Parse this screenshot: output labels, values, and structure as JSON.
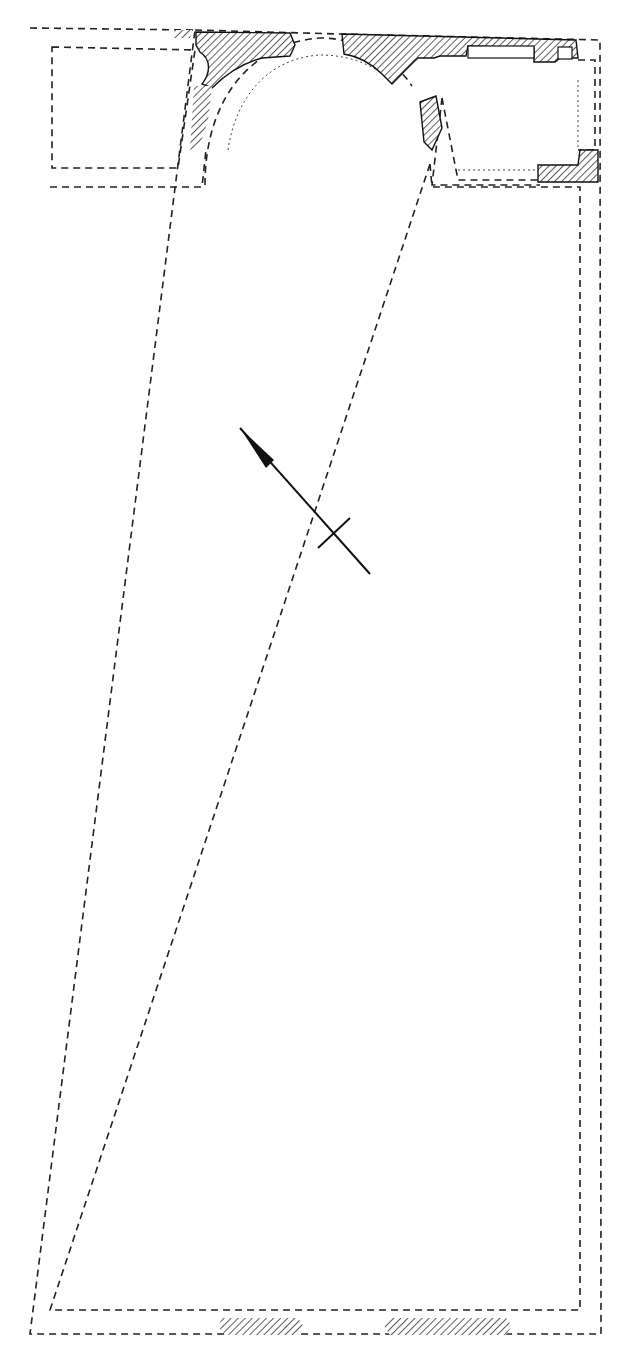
{
  "drawing": {
    "type": "architectural-floor-plan",
    "width": 633,
    "height": 1354,
    "colors": {
      "line": "#222222",
      "background": "#ffffff"
    },
    "elements": {
      "outer_wall_outline": "dashed",
      "inner_wall_outline": "dashed",
      "apse": "semicircular, top center",
      "side_chamber_left": "rectangular, top left",
      "side_chamber_right": "rectangular, top right",
      "surviving_masonry": "hatched fill",
      "north_arrow": "arrow with crossbar, pointing up-left"
    }
  }
}
